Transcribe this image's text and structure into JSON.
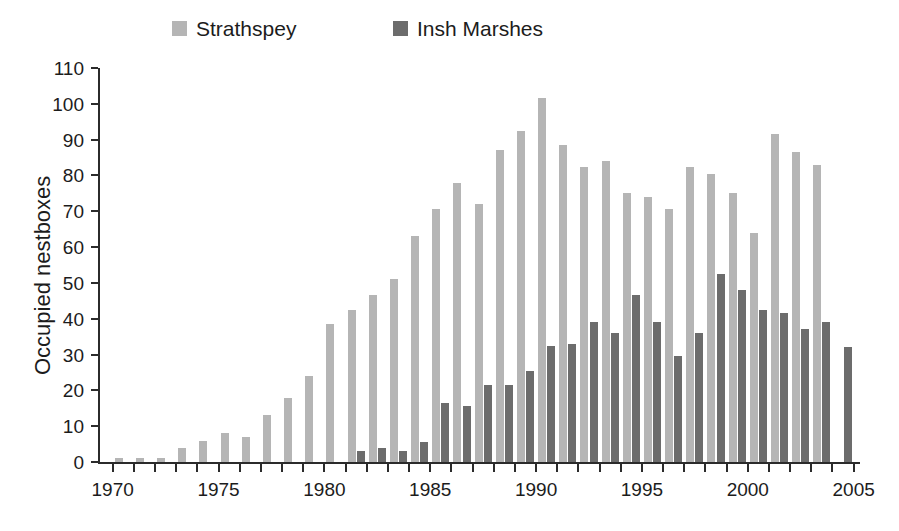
{
  "legend": {
    "position": "top",
    "entries": [
      {
        "label": "Strathspey",
        "color": "#b5b5b5"
      },
      {
        "label": "Insh Marshes",
        "color": "#6c6c6c"
      }
    ]
  },
  "chart_data": {
    "type": "bar",
    "title": "",
    "xlabel": "",
    "ylabel": "Occupied nestboxes",
    "ylim": [
      0,
      110
    ],
    "ytick_labels": [
      "0",
      "10",
      "20",
      "30",
      "40",
      "50",
      "60",
      "70",
      "80",
      "90",
      "100",
      "110"
    ],
    "ytick_values": [
      0,
      10,
      20,
      30,
      40,
      50,
      60,
      70,
      80,
      90,
      100,
      110
    ],
    "xlim": [
      1969.4,
      2005.3
    ],
    "xtick_labels": [
      "1970",
      "1975",
      "1980",
      "1985",
      "1990",
      "1995",
      "2000",
      "2005"
    ],
    "xtick_values": [
      1970,
      1975,
      1980,
      1985,
      1990,
      1995,
      2000,
      2005
    ],
    "minor_xticks": [
      1971,
      1972,
      1973,
      1974,
      1976,
      1977,
      1978,
      1979,
      1981,
      1982,
      1983,
      1984,
      1986,
      1987,
      1988,
      1989,
      1991,
      1992,
      1993,
      1994,
      1996,
      1997,
      1998,
      1999,
      2001,
      2002,
      2003,
      2004
    ],
    "grid": false,
    "categories": [
      1970,
      1971,
      1972,
      1973,
      1974,
      1975,
      1976,
      1977,
      1978,
      1979,
      1980,
      1981,
      1982,
      1983,
      1984,
      1985,
      1986,
      1987,
      1988,
      1989,
      1990,
      1991,
      1992,
      1993,
      1994,
      1995,
      1996,
      1997,
      1998,
      1999,
      2000,
      2001,
      2002,
      2003,
      2004
    ],
    "series": [
      {
        "name": "Strathspey",
        "color": "#b5b5b5",
        "values": [
          1,
          1,
          1,
          4,
          6,
          8,
          7,
          13,
          18,
          24,
          38.5,
          42.5,
          46.5,
          51,
          63,
          70.5,
          78,
          72,
          87,
          92.5,
          101.5,
          88.5,
          82.5,
          84,
          75,
          74,
          70.5,
          82.5,
          80.5,
          75,
          64,
          91.5,
          86.5,
          83,
          0
        ]
      },
      {
        "name": "Insh Marshes",
        "color": "#6c6c6c",
        "values": [
          0,
          0,
          0,
          0,
          0,
          0,
          0,
          0,
          0,
          0,
          0,
          3,
          4,
          3,
          5.5,
          16.5,
          15.5,
          21.5,
          21.5,
          25.5,
          32.5,
          33,
          39,
          36,
          46.5,
          39,
          29.5,
          36,
          52.5,
          48,
          42.5,
          41.5,
          37,
          39,
          32
        ]
      }
    ]
  },
  "axes_geometry": {
    "plot_left": 100,
    "plot_right": 860,
    "plot_top": 68,
    "plot_bottom": 462
  }
}
